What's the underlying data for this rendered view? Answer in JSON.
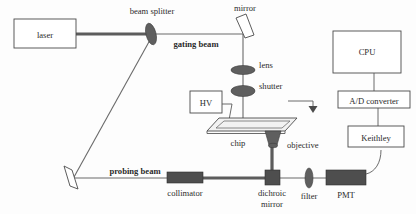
{
  "figure": {
    "background_color": "#fdfdfd",
    "line_color": "#5a5a5a",
    "optic_color": "#5f5f5f"
  },
  "boxes": {
    "laser": "laser",
    "hv": "HV",
    "cpu": "CPU",
    "adc": "A/D converter",
    "keithley": "Keithley"
  },
  "components": {
    "beam_splitter": "beam splitter",
    "mirror": "mirror",
    "lens": "lens",
    "shutter": "shutter",
    "chip": "chip",
    "objective": "objective",
    "collimator": "collimator",
    "dichroic_mirror_line1": "dichroic",
    "dichroic_mirror_line2": "mirror",
    "filter": "filter",
    "pmt": "PMT"
  },
  "beams": {
    "gating": "gating beam",
    "probing": "probing beam"
  },
  "icons": {
    "beam_splitter": "ellipse-optic-icon",
    "mirror": "tilted-mirror-icon",
    "lens": "ellipse-lens-icon",
    "shutter": "ellipse-shutter-icon",
    "objective": "objective-lens-icon",
    "dichroic": "dichroic-block-icon",
    "filter": "ellipse-filter-icon",
    "pmt": "pmt-block-icon",
    "flow_arrow": "down-arrow-icon",
    "turning_mirror": "tilted-mirror-icon"
  }
}
